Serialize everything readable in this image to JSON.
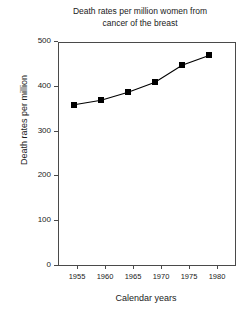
{
  "chart_data": {
    "type": "line",
    "title": "Death rates per million women from cancer of the breast",
    "title_lines": [
      "Death rates per million women from",
      "cancer of the breast"
    ],
    "xlabel": "Calendar years",
    "ylabel": "Death rates per million",
    "x": [
      1955,
      1960,
      1965,
      1970,
      1975,
      1980
    ],
    "values": [
      360,
      370,
      388,
      410,
      448,
      470
    ],
    "xlim": [
      1952,
      1985
    ],
    "ylim": [
      0,
      500
    ],
    "xticks": [
      1955,
      1960,
      1965,
      1970,
      1975,
      1980
    ],
    "xticklabels": [
      "1955",
      "1960",
      "1965",
      "1970",
      "1975",
      "1980"
    ],
    "yticks": [
      0,
      100,
      200,
      300,
      400,
      500
    ],
    "yticklabels": [
      "0",
      "100",
      "200",
      "300",
      "400",
      "500"
    ],
    "grid": false,
    "legend": "none",
    "marker": "square",
    "marker_color": "#000000",
    "line_color": "#000000",
    "frame_color": "#4a4a4a",
    "background": "#ffffff"
  }
}
